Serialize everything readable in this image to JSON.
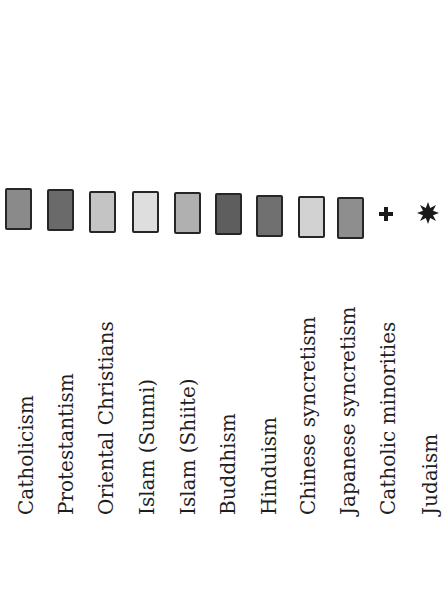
{
  "legend": {
    "items": [
      {
        "label": "Catholicism",
        "type": "swatch",
        "color": "#8a8a8a"
      },
      {
        "label": "Protestantism",
        "type": "swatch",
        "color": "#6a6a6a"
      },
      {
        "label": "Oriental Christians",
        "type": "swatch",
        "color": "#c4c4c4"
      },
      {
        "label": "Islam (Sunni)",
        "type": "swatch",
        "color": "#dedede"
      },
      {
        "label": "Islam (Shiite)",
        "type": "swatch",
        "color": "#b0b0b0"
      },
      {
        "label": "Buddhism",
        "type": "swatch",
        "color": "#5e5e5e"
      },
      {
        "label": "Hinduism",
        "type": "swatch",
        "color": "#707070"
      },
      {
        "label": "Chinese syncretism",
        "type": "swatch",
        "color": "#d2d2d2"
      },
      {
        "label": "Japanese syncretism",
        "type": "swatch",
        "color": "#8e8e8e"
      },
      {
        "label": "Catholic minorities",
        "type": "symbol",
        "icon": "cross-icon",
        "glyph": "✚"
      },
      {
        "label": "Judaism",
        "type": "symbol",
        "icon": "star-icon",
        "glyph": "✸"
      }
    ]
  }
}
